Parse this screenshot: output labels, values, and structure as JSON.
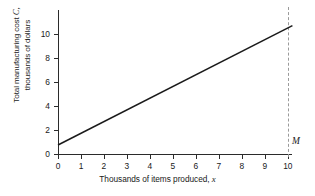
{
  "chart_data": {
    "type": "line",
    "title": "",
    "xlabel": "Thousands of items produced, x",
    "xlabel_main": "Thousands of items produced,",
    "xlabel_var": "x",
    "ylabel": "Total manufacturing cost C, thousands of dollars",
    "ylabel_line1_main": "Total manufacturing cost",
    "ylabel_line1_var": "C,",
    "ylabel_line2": "thousands of dollars",
    "xlim": [
      0,
      10.4
    ],
    "ylim": [
      0,
      12.1
    ],
    "xticks": [
      0,
      1,
      2,
      3,
      4,
      5,
      6,
      7,
      8,
      9,
      10
    ],
    "xticklabels": [
      "0",
      "1",
      "2",
      "3",
      "4",
      "5",
      "6",
      "7",
      "8",
      "9",
      "10"
    ],
    "yticks": [
      0,
      2,
      4,
      6,
      8,
      10
    ],
    "yticklabels": [
      "0",
      "2",
      "4",
      "6",
      "8",
      "10"
    ],
    "grid": false,
    "legend": false,
    "series": [
      {
        "name": "Total manufacturing cost",
        "x": [
          0,
          10.2
        ],
        "values": [
          0.75,
          10.7
        ],
        "color": "#1a1a1a",
        "style": "solid"
      }
    ],
    "annotations": [
      {
        "name": "M",
        "label": "M",
        "type": "vertical-dashed-line",
        "x": 10,
        "color": "#9a9a9a"
      }
    ]
  }
}
